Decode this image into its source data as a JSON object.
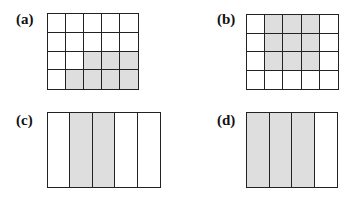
{
  "panels": [
    {
      "id": "a",
      "label": "(a)",
      "cols": 5,
      "rows": 4,
      "shaded": [
        [
          2,
          2
        ],
        [
          2,
          3
        ],
        [
          2,
          4
        ],
        [
          3,
          1
        ],
        [
          3,
          2
        ],
        [
          3,
          3
        ],
        [
          3,
          4
        ]
      ],
      "shaded_count": 7,
      "total_cells": 20
    },
    {
      "id": "b",
      "label": "(b)",
      "cols": 5,
      "rows": 4,
      "shaded": [
        [
          0,
          1
        ],
        [
          0,
          2
        ],
        [
          0,
          3
        ],
        [
          1,
          1
        ],
        [
          1,
          2
        ],
        [
          1,
          3
        ],
        [
          2,
          1
        ],
        [
          2,
          2
        ],
        [
          2,
          3
        ]
      ],
      "shaded_count": 9,
      "total_cells": 20
    },
    {
      "id": "c",
      "label": "(c)",
      "cols": 5,
      "rows": 1,
      "shaded": [
        [
          0,
          1
        ],
        [
          0,
          2
        ]
      ],
      "shaded_count": 2,
      "total_cells": 5
    },
    {
      "id": "d",
      "label": "(d)",
      "cols": 4,
      "rows": 1,
      "shaded": [
        [
          0,
          0
        ],
        [
          0,
          1
        ],
        [
          0,
          2
        ]
      ],
      "shaded_count": 3,
      "total_cells": 4
    }
  ],
  "colors": {
    "shaded": "#dedede",
    "line": "#222222",
    "background": "#ffffff"
  }
}
